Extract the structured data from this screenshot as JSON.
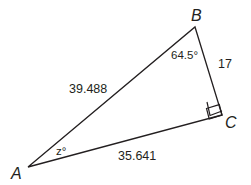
{
  "diagram": {
    "type": "right-triangle",
    "vertices": [
      {
        "id": "A",
        "label": "A",
        "x": 28,
        "y": 167
      },
      {
        "id": "B",
        "label": "B",
        "x": 195,
        "y": 27
      },
      {
        "id": "C",
        "label": "C",
        "x": 222,
        "y": 115
      }
    ],
    "sides": [
      {
        "between": "AB",
        "label": "39.488"
      },
      {
        "between": "BC",
        "label": "17"
      },
      {
        "between": "AC",
        "label": "35.641"
      }
    ],
    "angles": [
      {
        "at": "B",
        "label": "64.5°"
      },
      {
        "at": "A",
        "label": "z°"
      },
      {
        "at": "C",
        "label": "right-angle"
      }
    ],
    "stroke_color": "#231f20"
  }
}
